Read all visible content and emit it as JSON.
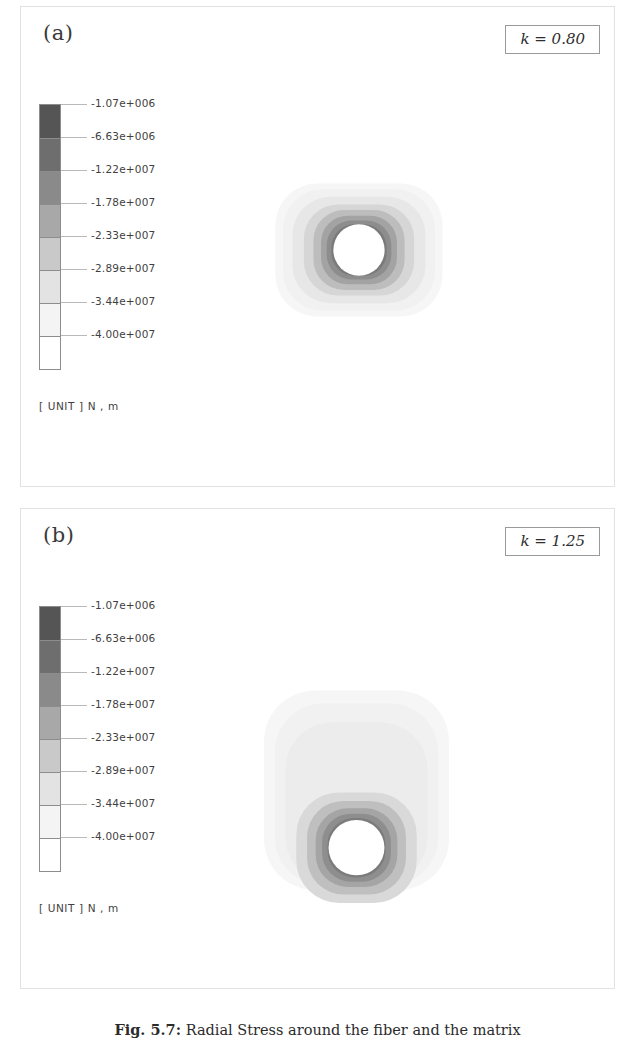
{
  "figure": {
    "caption_prefix": "Fig. 5.7:",
    "caption_text": "Radial Stress around the fiber and the matrix",
    "unit_label": "[ UNIT ] N , m"
  },
  "legend": {
    "tick_labels": [
      "-1.07e+006",
      "-6.63e+006",
      "-1.22e+007",
      "-1.78e+007",
      "-2.33e+007",
      "-2.89e+007",
      "-3.44e+007",
      "-4.00e+007"
    ],
    "band_colors": [
      "#555555",
      "#6e6e6e",
      "#8a8a8a",
      "#a8a8a8",
      "#c9c9c9",
      "#e3e3e3",
      "#f4f4f4",
      "#ffffff"
    ]
  },
  "panels": [
    {
      "id": "a",
      "label": "(a)",
      "k_label": "k = 0.80"
    },
    {
      "id": "b",
      "label": "(b)",
      "k_label": "k = 1.25"
    }
  ],
  "chart_data": {
    "type": "heatmap",
    "title": "Radial Stress around the fiber and the matrix",
    "colorbar_label": "[ UNIT ] N , m",
    "colorbar_ticks": [
      -1070000.0,
      -6630000.0,
      -12200000.0,
      -17800000.0,
      -23300000.0,
      -28900000.0,
      -34400000.0,
      -40000000.0
    ],
    "colorbar_tick_labels": [
      "-1.07e+006",
      "-6.63e+006",
      "-1.22e+007",
      "-1.78e+007",
      "-2.33e+007",
      "-2.89e+007",
      "-3.44e+007",
      "-4.00e+007"
    ],
    "colormap": "grayscale-8-band",
    "vmin": -40000000.0,
    "vmax": -1070000.0,
    "grid": false,
    "legend_position": "left",
    "panels": [
      {
        "label": "(a)",
        "parameter": "k",
        "parameter_value": 0.8,
        "parameter_label": "k = 0.80",
        "geometry": "circular fiber hole in matrix, rounded-square stress field",
        "field_aspect": "wider than tall",
        "rings": [
          {
            "level_index": 0,
            "value": -1070000.0,
            "color": "#555555",
            "radius_rel": 0.28
          },
          {
            "level_index": 1,
            "value": -6630000.0,
            "color": "#6e6e6e",
            "radius_rel": 0.33
          },
          {
            "level_index": 2,
            "value": -12200000.0,
            "color": "#8a8a8a",
            "radius_rel": 0.39
          },
          {
            "level_index": 3,
            "value": -17800000.0,
            "color": "#a8a8a8",
            "radius_rel": 0.46
          },
          {
            "level_index": 4,
            "value": -23300000.0,
            "color": "#c9c9c9",
            "radius_rel": 0.56
          },
          {
            "level_index": 5,
            "value": -28900000.0,
            "color": "#e3e3e3",
            "radius_rel": 0.7
          },
          {
            "level_index": 6,
            "value": -34400000.0,
            "color": "#f4f4f4",
            "radius_rel": 0.88
          }
        ]
      },
      {
        "label": "(b)",
        "parameter": "k",
        "parameter_value": 1.25,
        "parameter_label": "k = 1.25",
        "geometry": "circular fiber hole in matrix, rounded-square stress field",
        "field_aspect": "taller than wide",
        "rings": [
          {
            "level_index": 0,
            "value": -1070000.0,
            "color": "#555555",
            "radius_rel": 0.26
          },
          {
            "level_index": 1,
            "value": -6630000.0,
            "color": "#6e6e6e",
            "radius_rel": 0.31
          },
          {
            "level_index": 2,
            "value": -12200000.0,
            "color": "#8a8a8a",
            "radius_rel": 0.36
          },
          {
            "level_index": 3,
            "value": -17800000.0,
            "color": "#a8a8a8",
            "radius_rel": 0.43
          },
          {
            "level_index": 4,
            "value": -23300000.0,
            "color": "#c9c9c9",
            "radius_rel": 0.53
          },
          {
            "level_index": 5,
            "value": -28900000.0,
            "color": "#e3e3e3",
            "radius_rel": 0.68
          },
          {
            "level_index": 6,
            "value": -34400000.0,
            "color": "#f4f4f4",
            "radius_rel": 0.86
          }
        ]
      }
    ]
  }
}
